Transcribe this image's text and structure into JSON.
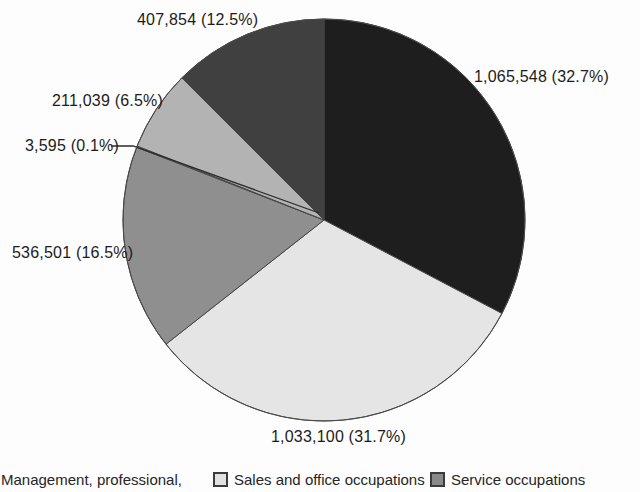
{
  "figure": {
    "background": "#fdfdfd",
    "text_color": "#1c1c1c"
  },
  "chart_data": {
    "type": "pie",
    "title": "",
    "start_angle_deg": 0,
    "direction": "clockwise",
    "legend_position": "bottom",
    "slices": [
      {
        "label": "1,065,548 (32.7%)",
        "value": 1065548,
        "pct": 32.7,
        "color": "#1e1e1e"
      },
      {
        "label": "1,033,100 (31.7%)",
        "value": 1033100,
        "pct": 31.7,
        "color": "#e5e5e5"
      },
      {
        "label": "536,501 (16.5%)",
        "value": 536501,
        "pct": 16.5,
        "color": "#8f8f8f"
      },
      {
        "label": "3,595 (0.1%)",
        "value": 3595,
        "pct": 0.1,
        "color": "#f2f2f2"
      },
      {
        "label": "211,039 (6.5%)",
        "value": 211039,
        "pct": 6.5,
        "color": "#b3b3b3"
      },
      {
        "label": "407,854 (12.5%)",
        "value": 407854,
        "pct": 12.5,
        "color": "#404040"
      }
    ],
    "legend": [
      {
        "label": "Management, professional,",
        "swatch_color": null
      },
      {
        "label": "Sales and office occupations",
        "swatch_color": "#e2e2e2"
      },
      {
        "label": "Service occupations",
        "swatch_color": "#8a8a8a"
      }
    ]
  }
}
